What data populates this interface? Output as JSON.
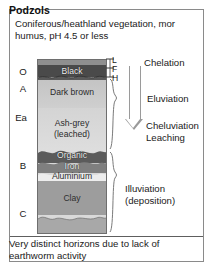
{
  "figure": {
    "title": "Podzols",
    "subtitle": "Coniferous/heathland vegetation, mor humus, pH 4.5 or less",
    "footer": "Very distinct horizons due to lack of earthworm activity",
    "frame_color": "#8a8a8a",
    "text_color": "#1a1a1a"
  },
  "horizons": [
    {
      "code": "O",
      "name": "organic-horizon"
    },
    {
      "code": "A",
      "name": "a-horizon"
    },
    {
      "code": "Ea",
      "name": "ea-horizon"
    },
    {
      "code": "B",
      "name": "b-horizon"
    },
    {
      "code": "C",
      "name": "c-horizon"
    }
  ],
  "layer_markers": [
    {
      "code": "L",
      "name": "litter-layer"
    },
    {
      "code": "F",
      "name": "fermentation-layer"
    },
    {
      "code": "H",
      "name": "humus-layer"
    }
  ],
  "profile": {
    "bands": [
      {
        "label": "",
        "color": "#8f8f8f",
        "name": "surface-litter-band"
      },
      {
        "label": "Black",
        "color": "#4a4a4a",
        "name": "black-humus-band"
      },
      {
        "label": "Dark brown",
        "color": "#c9c9c9",
        "name": "dark-brown-band"
      },
      {
        "label": "Ash-grey",
        "color": "#d5d5d5",
        "name": "ash-grey-band"
      },
      {
        "label": "(leached)",
        "color": "#d5d5d5",
        "name": "ash-grey-leached-band"
      },
      {
        "label": "Organic",
        "color": "#5e5e5e",
        "name": "organic-band"
      },
      {
        "label": "Iron",
        "color": "#7d7d7d",
        "name": "iron-band"
      },
      {
        "label": "Aluminium",
        "color": "#efefef",
        "name": "aluminium-band"
      },
      {
        "label": "Clay",
        "color": "#9d9d9d",
        "name": "clay-band"
      },
      {
        "label": "",
        "color": "#ababab",
        "name": "parent-material-band"
      }
    ]
  },
  "processes": [
    {
      "label": "Chelation",
      "name": "chelation-label"
    },
    {
      "label": "Eluviation",
      "name": "eluviation-label"
    },
    {
      "label": "Cheluviation",
      "name": "cheluviation-label"
    },
    {
      "label": "Leaching",
      "name": "leaching-label"
    },
    {
      "label": "Illuviation",
      "name": "illuviation-label"
    },
    {
      "label": "(deposition)",
      "name": "deposition-label"
    }
  ],
  "arrow": {
    "name": "downward-process-arrow",
    "direction": "down",
    "color": "#9a9a9a"
  }
}
